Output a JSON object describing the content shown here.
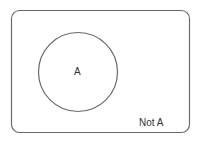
{
  "diagram": {
    "type": "venn",
    "universe": {
      "label": "Not A"
    },
    "sets": [
      {
        "label": "A"
      }
    ],
    "stroke_color": "#666666"
  }
}
